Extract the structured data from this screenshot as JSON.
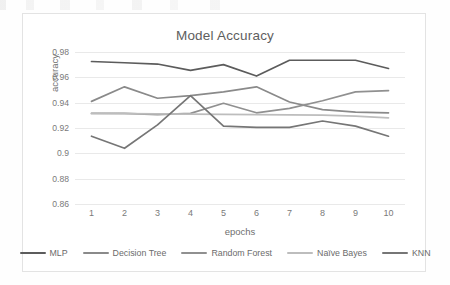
{
  "chart_data": {
    "type": "line",
    "title": "Model Accuracy",
    "xlabel": "epochs",
    "ylabel": "accuracy",
    "x": [
      1,
      2,
      3,
      4,
      5,
      6,
      7,
      8,
      9,
      10
    ],
    "xtick_labels": [
      "1",
      "2",
      "3",
      "4",
      "5",
      "6",
      "7",
      "8",
      "9",
      "10"
    ],
    "ytick_labels": [
      "0.98",
      "0.96",
      "0.94",
      "0.92",
      "0.9",
      "0.88",
      "0.86"
    ],
    "ytick_values": [
      0.98,
      0.96,
      0.94,
      0.92,
      0.9,
      0.88,
      0.86
    ],
    "ylim": [
      0.85,
      0.985
    ],
    "grid": true,
    "legend_position": "bottom",
    "series": [
      {
        "name": "MLP",
        "color": "#5c5c5c",
        "values": [
          0.9725,
          0.9715,
          0.9705,
          0.9655,
          0.97,
          0.961,
          0.9735,
          0.9735,
          0.9735,
          0.967
        ]
      },
      {
        "name": "Decision Tree",
        "color": "#8a8a8a",
        "values": [
          0.941,
          0.9525,
          0.9435,
          0.9455,
          0.9485,
          0.9525,
          0.9405,
          0.9345,
          0.9325,
          0.932
        ]
      },
      {
        "name": "Random Forest",
        "color": "#909090",
        "values": [
          0.9315,
          0.9315,
          0.9305,
          0.9315,
          0.9395,
          0.932,
          0.9355,
          0.9415,
          0.9485,
          0.9495
        ]
      },
      {
        "name": "Naïve Bayes",
        "color": "#bdbdbd",
        "values": [
          0.9315,
          0.9313,
          0.9311,
          0.9309,
          0.9307,
          0.9305,
          0.9303,
          0.9301,
          0.9293,
          0.928
        ]
      },
      {
        "name": "KNN",
        "color": "#767676",
        "values": [
          0.9135,
          0.904,
          0.9225,
          0.9455,
          0.9215,
          0.9205,
          0.9205,
          0.9255,
          0.9215,
          0.9135
        ]
      }
    ]
  }
}
